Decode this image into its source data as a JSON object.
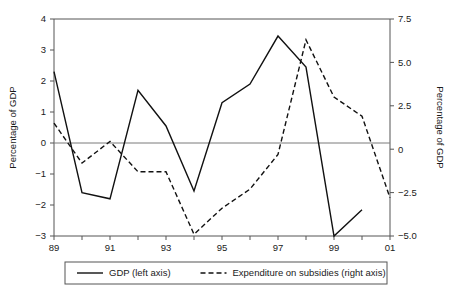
{
  "chart_data": {
    "type": "line",
    "title": "",
    "subtitle": "",
    "xlabel": "",
    "ylabel": "Percentage of GDP",
    "y2label": "Percentage of GDP",
    "grid": false,
    "legend_position": "bottom",
    "x": [
      "89",
      "90",
      "91",
      "92",
      "93",
      "94",
      "95",
      "96",
      "97",
      "98",
      "99",
      "00",
      "01"
    ],
    "x_tick_labels_shown": [
      "89",
      "91",
      "93",
      "95",
      "97",
      "99",
      "01"
    ],
    "ylim": [
      -3,
      4
    ],
    "y_ticks": [
      "4",
      "3",
      "2",
      "1",
      "0",
      "-1",
      "-2",
      "-3"
    ],
    "y2lim": [
      -5.0,
      7.5
    ],
    "y2_ticks": [
      "7.5",
      "5.0",
      "2.5",
      "0",
      "-2.5",
      "-5.0"
    ],
    "series": [
      {
        "name": "GDP (left axis)",
        "axis": "left",
        "style": "solid",
        "values": [
          2.3,
          -1.6,
          -1.8,
          1.7,
          0.55,
          -1.55,
          1.3,
          1.9,
          3.45,
          2.45,
          -3.0,
          -2.15,
          null
        ]
      },
      {
        "name": "Expenditure on subsidies (right axis)",
        "axis": "right",
        "style": "dashed",
        "values": [
          1.5,
          -0.8,
          0.45,
          -1.3,
          -1.3,
          -4.9,
          -3.4,
          -2.3,
          -0.3,
          6.3,
          3.0,
          1.9,
          -2.8
        ]
      }
    ]
  },
  "legend": {
    "items": [
      {
        "label": "GDP (left axis)",
        "style": "solid"
      },
      {
        "label": "Expenditure on subsidies (right axis)",
        "style": "dashed"
      }
    ]
  },
  "axes": {
    "left_title": "Percentage of GDP",
    "right_title": "Percentage of GDP"
  },
  "colors": {
    "line": "#111111",
    "axis": "#555555",
    "zero": "#7a7a7a",
    "background": "#ffffff"
  }
}
